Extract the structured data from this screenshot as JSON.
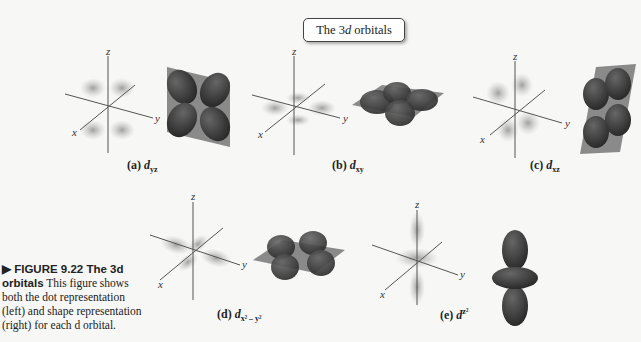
{
  "header": {
    "title_prefix": "The 3",
    "title_italic": "d",
    "title_suffix": " orbitals"
  },
  "panels": [
    {
      "id": "a",
      "label": "(a) ",
      "sym": "d",
      "sub": "yz",
      "shape": "four-lobe-vertical-plane-yz"
    },
    {
      "id": "b",
      "label": "(b) ",
      "sym": "d",
      "sub": "xy",
      "shape": "four-lobe-horizontal-plane-xy"
    },
    {
      "id": "c",
      "label": "(c) ",
      "sym": "d",
      "sub": "xz",
      "shape": "four-lobe-vertical-plane-xz"
    },
    {
      "id": "d",
      "label": "(d) ",
      "sym": "d",
      "sub": "x² – y²",
      "shape": "four-lobe-along-axes"
    },
    {
      "id": "e",
      "label": "(e) ",
      "sym": "d",
      "sub": "z²",
      "shape": "dumbbell-with-torus"
    }
  ],
  "axes": {
    "x": "x",
    "y": "y",
    "z": "z"
  },
  "figure": {
    "label": "▶ FIGURE 9.22  The 3d orbitals",
    "text": "This figure shows both the dot representation (left) and shape representation (right) for each d orbital."
  },
  "colors": {
    "lobe": "#3a3a3a",
    "plane": "#8a8a8a",
    "dots": "#9a9a9a",
    "axis": "#555555"
  }
}
